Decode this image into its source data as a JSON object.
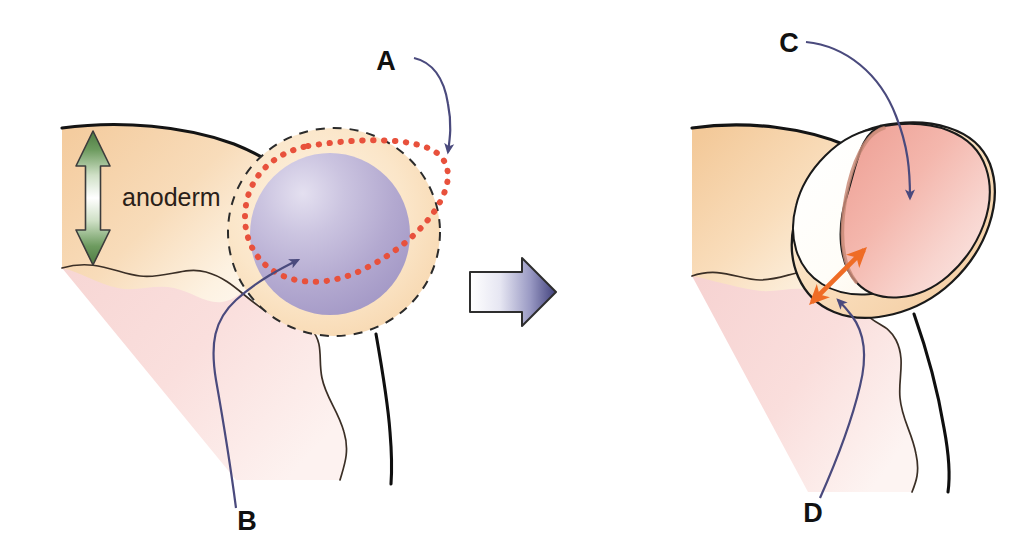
{
  "figure": {
    "title": "",
    "type": "anatomical-diagram",
    "background_color": "#ffffff",
    "width": 1034,
    "height": 558
  },
  "labels": {
    "anoderm": "anoderm",
    "a": "A",
    "b": "B",
    "c": "C",
    "d": "D"
  },
  "palette": {
    "anoderm_fill": "#f6d2a9",
    "anoderm_fill_light": "#fdf0de",
    "submucosa_pink": "#f8d8d6",
    "submucosa_pink_light": "#fdf1ef",
    "hemorrhoid_purple": "#b0a6cf",
    "hemorrhoid_purple_light": "#ded9ee",
    "raw_surface_pink": "#f2ada4",
    "raw_surface_pink_light": "#fbe7e6",
    "outline_black": "#1a1a1a",
    "dashed_black": "#2b2b2b",
    "incision_red": "#e8513c",
    "pointer_navy": "#4a4a7d",
    "measure_orange": "#ef6c26",
    "anoderm_arrow_green": "#5f8a52",
    "transition_arrow_dark": "#4a4a86"
  },
  "panels": {
    "left": {
      "name": "pre-operative-anal-canal",
      "elements": [
        {
          "key": "anoderm_band",
          "name": "anoderm-tissue-band"
        },
        {
          "key": "submucosa",
          "name": "submucosa-tissue"
        },
        {
          "key": "hemorrhoid",
          "name": "hemorrhoid-cushion"
        },
        {
          "key": "dashed_circle",
          "name": "dashed-boundary-circle"
        },
        {
          "key": "red_dotted",
          "name": "red-dotted-incision-line"
        },
        {
          "key": "green_arrow",
          "name": "anoderm-thickness-arrow"
        }
      ]
    },
    "right": {
      "name": "post-excision-anal-canal",
      "elements": [
        {
          "key": "anoderm_band",
          "name": "anoderm-tissue-band"
        },
        {
          "key": "submucosa",
          "name": "submucosa-tissue"
        },
        {
          "key": "raw_surface",
          "name": "raw-wound-surface"
        },
        {
          "key": "orange_arrow",
          "name": "defect-width-arrow"
        }
      ]
    }
  },
  "annotations": [
    {
      "id": "A",
      "name": "callout-a",
      "panel": "left",
      "label_x": 396,
      "label_y": 62,
      "target": "red-dotted-incision-line"
    },
    {
      "id": "B",
      "name": "callout-b",
      "panel": "left",
      "label_x": 247,
      "label_y": 521,
      "target": "hemorrhoid-cushion"
    },
    {
      "id": "C",
      "name": "callout-c",
      "panel": "right",
      "label_x": 789,
      "label_y": 44,
      "target": "raw-wound-surface"
    },
    {
      "id": "D",
      "name": "callout-d",
      "panel": "right",
      "label_x": 813,
      "label_y": 513,
      "target": "defect-width-arrow"
    }
  ],
  "transition": {
    "name": "transition-arrow",
    "direction": "left-to-right",
    "gradient_from": "#ffffff",
    "gradient_to": "#4a4a86"
  }
}
